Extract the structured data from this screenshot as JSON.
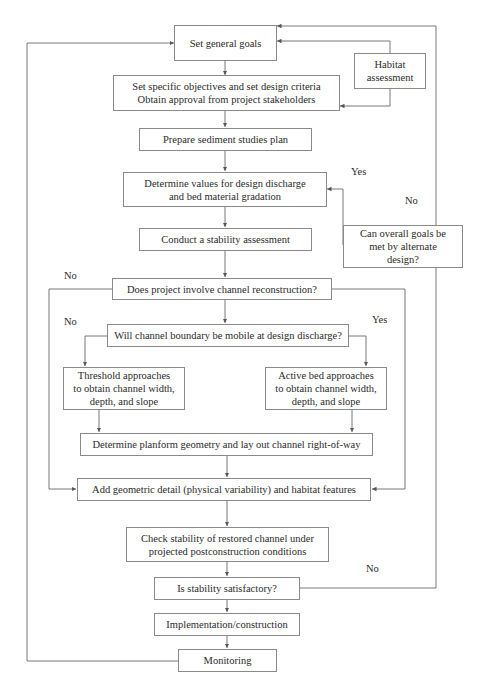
{
  "diagram": {
    "type": "flowchart",
    "nodes": {
      "general_goals": "Set general goals",
      "habitat": "Habitat\nassessment",
      "objectives": "Set specific objectives and set design criteria\nObtain approval from project stakeholders",
      "sediment_plan": "Prepare sediment studies plan",
      "design_discharge": "Determine values for design discharge\nand bed material gradation",
      "alternate_design": "Can overall goals be\nmet by alternate\ndesign?",
      "stability_assessment": "Conduct a stability assessment",
      "reconstruction": "Does project involve channel reconstruction?",
      "mobile_boundary": "Will channel boundary be mobile at design discharge?",
      "threshold": "Threshold approaches\nto obtain channel width,\ndepth, and slope",
      "active_bed": "Active bed approaches\nto obtain channel width,\ndepth, and slope",
      "planform": "Determine planform geometry and lay out channel right-of-way",
      "geometric_detail": "Add geometric detail (physical variability) and habitat features",
      "check_stability": "Check stability of restored channel under\nprojected postconstruction conditions",
      "satisfactory": "Is stability satisfactory?",
      "implementation": "Implementation/construction",
      "monitoring": "Monitoring"
    },
    "labels": {
      "alt_yes": "Yes",
      "alt_no": "No",
      "recon_no": "No",
      "mobile_no": "No",
      "mobile_yes": "Yes",
      "satisfactory_no": "No"
    },
    "colors": {
      "line": "#6a6a6a",
      "border": "#8a8a8a",
      "text": "#2a2a2a"
    }
  }
}
